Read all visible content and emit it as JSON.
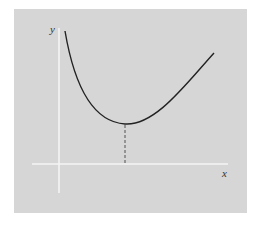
{
  "figure": {
    "background_color": "#d6d6d6",
    "axis_color": "#f4f4f4",
    "curve_color": "#222222",
    "x_axis_label": "x",
    "y_axis_label": "y",
    "curve_description": "convex curve with a single minimum; dashed vertical line drops from the minimum to the x-axis"
  }
}
